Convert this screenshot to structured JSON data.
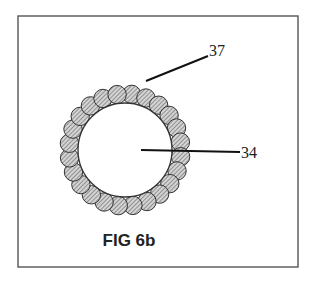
{
  "figure": {
    "caption": "FIG 6b",
    "frame": {
      "x": 18,
      "y": 16,
      "width": 280,
      "height": 251,
      "stroke": "#555555"
    },
    "core": {
      "cx": 125,
      "cy": 150,
      "r": 47,
      "fill": "#ffffff",
      "stroke": "#333333"
    },
    "beads": {
      "count": 24,
      "ring_radius": 56,
      "r": 9.2,
      "fill": "#d0d0d0",
      "hatch": "#555555",
      "stroke": "#333333"
    },
    "labels": [
      {
        "id": "37",
        "text": "37",
        "x": 209,
        "y": 56,
        "line": {
          "x1": 146,
          "y1": 81,
          "x2": 208,
          "y2": 56
        }
      },
      {
        "id": "34",
        "text": "34",
        "x": 241,
        "y": 158,
        "line": {
          "x1": 141,
          "y1": 150,
          "x2": 240,
          "y2": 152
        }
      }
    ]
  }
}
